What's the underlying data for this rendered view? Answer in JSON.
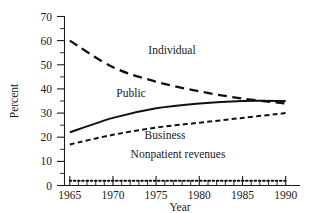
{
  "chart_data": {
    "type": "line",
    "title": "",
    "xlabel": "Year",
    "ylabel": "Percent",
    "xlim": [
      1964,
      1991
    ],
    "ylim": [
      0,
      70
    ],
    "grid": false,
    "legend_position": "inline-labels",
    "x_ticks": [
      1965,
      1970,
      1975,
      1980,
      1985,
      1990
    ],
    "x_tick_labels": [
      "1965",
      "1970",
      "1975",
      "1980",
      "1985",
      "1990"
    ],
    "x_minor_tick_step": 1,
    "y_ticks": [
      0,
      10,
      20,
      30,
      40,
      50,
      60,
      70
    ],
    "y_tick_labels": [
      "0",
      "10",
      "20",
      "30",
      "40",
      "50",
      "60",
      "70"
    ],
    "y_minor_tick_step": 5,
    "x": [
      1965,
      1970,
      1975,
      1980,
      1985,
      1990
    ],
    "series": [
      {
        "name": "Individual",
        "style": "long-dash",
        "color": "#111111",
        "values": [
          60,
          49,
          43,
          39,
          36,
          34
        ],
        "label_x": 1977,
        "label_y": 52
      },
      {
        "name": "Public",
        "style": "solid",
        "color": "#111111",
        "values": [
          22,
          28,
          32,
          34,
          35,
          35
        ],
        "label_x": 1973,
        "label_y": 38
      },
      {
        "name": "Business",
        "style": "short-dash",
        "color": "#111111",
        "values": [
          17,
          21,
          24,
          26,
          28,
          30
        ],
        "label_x": 1977,
        "label_y": 22
      },
      {
        "name": "Nonpatient revenues",
        "style": "dotted",
        "color": "#111111",
        "values": [
          2,
          2,
          2,
          2,
          2,
          2
        ],
        "label_x": 1978,
        "label_y": 9
      }
    ]
  },
  "axes": {
    "y_title": "Percent",
    "x_title": "Year"
  },
  "labels": {
    "individual": "Individual",
    "public": "Public",
    "business": "Business",
    "nonpatient": "Nonpatient revenues"
  },
  "y_tick_text": [
    "70",
    "60",
    "50",
    "40",
    "30",
    "20",
    "10",
    "0"
  ],
  "x_tick_text": [
    "1965",
    "1970",
    "1975",
    "1980",
    "1985",
    "1990"
  ]
}
